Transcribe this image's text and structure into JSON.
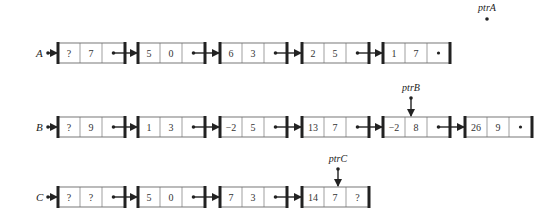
{
  "diagram": {
    "type": "linked-lists",
    "lists": [
      {
        "name": "A",
        "row_y": 53,
        "nodes": [
          {
            "a": "?",
            "b": "7",
            "next": "pointer"
          },
          {
            "a": "5",
            "b": "0",
            "next": "pointer"
          },
          {
            "a": "6",
            "b": "3",
            "next": "pointer"
          },
          {
            "a": "2",
            "b": "5",
            "next": "pointer"
          },
          {
            "a": "1",
            "b": "7",
            "next": "null"
          }
        ]
      },
      {
        "name": "B",
        "row_y": 127,
        "nodes": [
          {
            "a": "?",
            "b": "9",
            "next": "pointer"
          },
          {
            "a": "1",
            "b": "3",
            "next": "pointer"
          },
          {
            "a": "−2",
            "b": "5",
            "next": "pointer"
          },
          {
            "a": "13",
            "b": "7",
            "next": "pointer"
          },
          {
            "a": "−2",
            "b": "8",
            "next": "pointer"
          },
          {
            "a": "26",
            "b": "9",
            "next": "null"
          }
        ]
      },
      {
        "name": "C",
        "row_y": 197,
        "nodes": [
          {
            "a": "?",
            "b": "?",
            "next": "pointer"
          },
          {
            "a": "5",
            "b": "0",
            "next": "pointer"
          },
          {
            "a": "7",
            "b": "3",
            "next": "pointer"
          },
          {
            "a": "14",
            "b": "7",
            "next": "?"
          }
        ]
      }
    ],
    "pointers": [
      {
        "name": "ptrA",
        "label_x": 487,
        "label_y": 11,
        "dot_y": 19,
        "target": null
      },
      {
        "name": "ptrB",
        "list": 1,
        "node": 4,
        "label_x": 411,
        "label_y": 91,
        "dot_y": 98
      },
      {
        "name": "ptrC",
        "list": 2,
        "node": 3,
        "label_x": 338,
        "label_y": 162,
        "dot_y": 169
      }
    ],
    "colors": {
      "line": "#222222",
      "box_fill": "#ffffff",
      "text": "#333333"
    }
  }
}
